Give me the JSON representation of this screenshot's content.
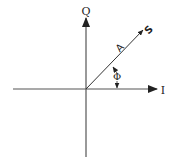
{
  "diagram": {
    "type": "phasor-diagram",
    "axes": {
      "horizontal_label": "I",
      "vertical_label": "Q"
    },
    "vector": {
      "name_label": "S",
      "magnitude_label": "A"
    },
    "angle": {
      "label": "Φ"
    },
    "colors": {
      "ink": "#222222",
      "background": "#ffffff"
    }
  }
}
